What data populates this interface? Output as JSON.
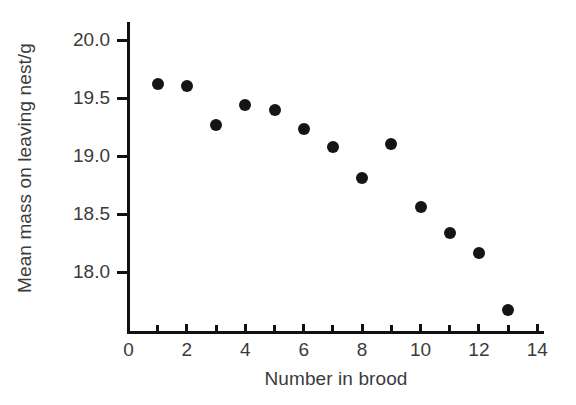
{
  "chart_data": {
    "type": "scatter",
    "title": "",
    "xlabel": "Number in brood",
    "ylabel": "Mean mass on leaving nest/g",
    "x": [
      1,
      2,
      3,
      4,
      5,
      6,
      7,
      8,
      9,
      10,
      11,
      12,
      13
    ],
    "values": [
      19.62,
      19.6,
      19.27,
      19.44,
      19.4,
      19.23,
      19.08,
      18.81,
      19.1,
      18.56,
      18.34,
      18.16,
      17.67
    ],
    "xlim": [
      0,
      14
    ],
    "ylim": [
      17.55,
      20.1
    ],
    "xticks": [
      0,
      1,
      2,
      3,
      4,
      5,
      6,
      7,
      8,
      9,
      10,
      11,
      12,
      13,
      14
    ],
    "xtick_labels": [
      "0",
      "",
      "2",
      "",
      "4",
      "",
      "6",
      "",
      "8",
      "",
      "10",
      "",
      "12",
      "",
      "14"
    ],
    "yticks": [
      18.0,
      18.5,
      19.0,
      19.5,
      20.0
    ],
    "ytick_labels": [
      "18.0",
      "18.5",
      "19.0",
      "19.5",
      "20.0"
    ],
    "grid": false,
    "legend": null,
    "marker": "filled-circle",
    "marker_color": "#151515",
    "axis_color": "#111111",
    "text_color": "#3b3b3b",
    "background": "#ffffff"
  }
}
